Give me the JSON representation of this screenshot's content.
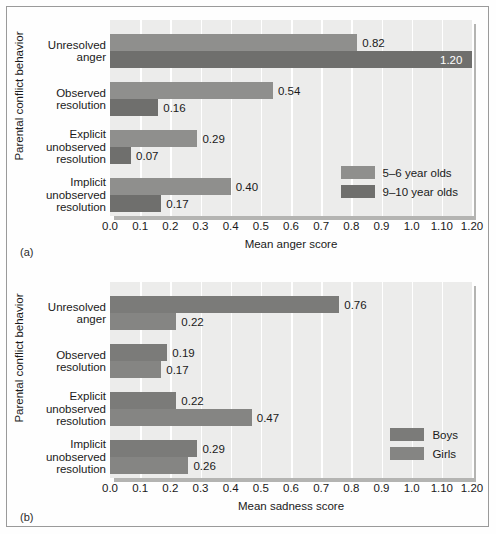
{
  "figure": {
    "panels": [
      {
        "key": "a",
        "marker": "(a)",
        "ylabel": "Parental conflict behavior",
        "xlabel": "Mean anger score"
      },
      {
        "key": "b",
        "marker": "(b)",
        "ylabel": "Parental conflict behavior",
        "xlabel": "Mean sadness score"
      }
    ]
  },
  "chart_data": [
    {
      "type": "bar",
      "orientation": "horizontal",
      "panel": "(a)",
      "title": "",
      "xlabel": "Mean anger score",
      "ylabel": "Parental conflict behavior",
      "xlim": [
        0.0,
        1.2
      ],
      "grid": true,
      "legend_position": "inside-bottom-right",
      "tick_labels": [
        "0.0",
        "0.1",
        "0.2",
        "0.3",
        "0.4",
        "0.5",
        "0.6",
        "0.7",
        "0.8",
        "0.9",
        "1.0",
        "1.10",
        "1.20"
      ],
      "tick_values": [
        0.0,
        0.1,
        0.2,
        0.3,
        0.4,
        0.5,
        0.6,
        0.7,
        0.8,
        0.9,
        1.0,
        1.1,
        1.2
      ],
      "categories": [
        [
          "Unresolved",
          "anger"
        ],
        [
          "Observed",
          "resolution"
        ],
        [
          "Explicit",
          "unobserved",
          "resolution"
        ],
        [
          "Implicit",
          "unobserved",
          "resolution"
        ]
      ],
      "series": [
        {
          "name": "5–6 year olds",
          "color": "#8f8f8d",
          "values": [
            0.82,
            0.54,
            0.29,
            0.4
          ],
          "labels": [
            "0.82",
            "0.54",
            "0.29",
            "0.40"
          ]
        },
        {
          "name": "9–10 year olds",
          "color": "#6f6f6d",
          "values": [
            1.2,
            0.16,
            0.07,
            0.17
          ],
          "labels": [
            "1.20",
            "0.16",
            "0.07",
            "0.17"
          ]
        }
      ]
    },
    {
      "type": "bar",
      "orientation": "horizontal",
      "panel": "(b)",
      "title": "",
      "xlabel": "Mean sadness score",
      "ylabel": "Parental conflict behavior",
      "xlim": [
        0.0,
        1.2
      ],
      "grid": true,
      "legend_position": "inside-bottom-right",
      "tick_labels": [
        "0.0",
        "0.1",
        "0.2",
        "0.3",
        "0.4",
        "0.5",
        "0.6",
        "0.7",
        "0.8",
        "0.9",
        "1.0",
        "1.10",
        "1.20"
      ],
      "tick_values": [
        0.0,
        0.1,
        0.2,
        0.3,
        0.4,
        0.5,
        0.6,
        0.7,
        0.8,
        0.9,
        1.0,
        1.1,
        1.2
      ],
      "categories": [
        [
          "Unresolved",
          "anger"
        ],
        [
          "Observed",
          "resolution"
        ],
        [
          "Explicit",
          "unobserved",
          "resolution"
        ],
        [
          "Implicit",
          "unobserved",
          "resolution"
        ]
      ],
      "series": [
        {
          "name": "Boys",
          "color": "#7b7b79",
          "values": [
            0.76,
            0.19,
            0.22,
            0.29
          ],
          "labels": [
            "0.76",
            "0.19",
            "0.22",
            "0.29"
          ]
        },
        {
          "name": "Girls",
          "color": "#858583",
          "values": [
            0.22,
            0.17,
            0.47,
            0.26
          ],
          "labels": [
            "0.22",
            "0.17",
            "0.47",
            "0.26"
          ]
        }
      ]
    }
  ]
}
